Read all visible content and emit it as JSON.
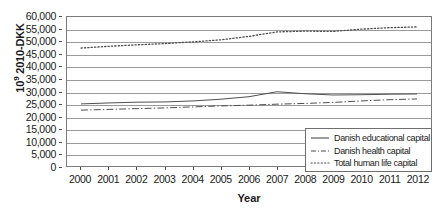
{
  "chart_data": {
    "type": "line",
    "title": "",
    "xlabel": "Year",
    "ylabel": "10⁹ 2010-DKK",
    "ylabel_prefix": "10",
    "ylabel_exponent": "9",
    "ylabel_suffix": " 2010-DKK",
    "x": [
      2000,
      2001,
      2002,
      2003,
      2004,
      2005,
      2006,
      2007,
      2008,
      2009,
      2010,
      2011,
      2012
    ],
    "xtick_labels": [
      "2000",
      "2001",
      "2002",
      "2003",
      "2004",
      "2005",
      "2006",
      "2007",
      "2008",
      "2009",
      "2010",
      "2011",
      "2012"
    ],
    "ylim": [
      0,
      60000
    ],
    "ytick_values": [
      0,
      5000,
      10000,
      15000,
      20000,
      25000,
      30000,
      35000,
      40000,
      45000,
      50000,
      55000,
      60000
    ],
    "ytick_labels": [
      "0",
      "5,000",
      "10,000",
      "15,000",
      "20,000",
      "25,000",
      "30,000",
      "35,000",
      "40,000",
      "45,000",
      "50,000",
      "55,000",
      "60,000"
    ],
    "grid": true,
    "grid_axis": "y",
    "legend_position": "bottom-right",
    "series": [
      {
        "name": "Danish educational capital",
        "style": "solid",
        "color": "#4d4d4d",
        "values": [
          25000,
          25400,
          25700,
          25800,
          26200,
          26900,
          27900,
          29900,
          29100,
          28600,
          28700,
          28900,
          29000
        ]
      },
      {
        "name": "Danish health capital",
        "style": "dash-dot",
        "color": "#4d4d4d",
        "values": [
          22500,
          22800,
          23100,
          23400,
          23800,
          24200,
          24500,
          24900,
          25200,
          25600,
          26200,
          26700,
          27000
        ]
      },
      {
        "name": "Total human life capital",
        "style": "dotted",
        "color": "#4d4d4d",
        "values": [
          47500,
          48200,
          48800,
          49300,
          50000,
          50800,
          52200,
          54000,
          54300,
          54200,
          55100,
          55700,
          56000
        ]
      }
    ]
  },
  "legend": {
    "items": [
      {
        "label": "Danish educational capital",
        "style": "solid"
      },
      {
        "label": "Danish health capital",
        "style": "dash-dot"
      },
      {
        "label": "Total human life capital",
        "style": "dotted"
      }
    ]
  }
}
